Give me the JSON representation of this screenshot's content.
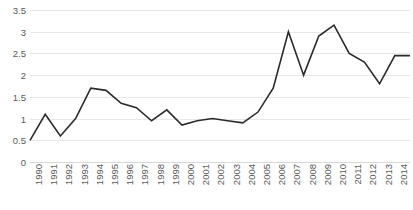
{
  "chart_data": {
    "type": "line",
    "title": "",
    "subtitle": "",
    "xlabel": "",
    "ylabel": "",
    "ylim": [
      0,
      3.5
    ],
    "ytick_values": [
      0,
      0.5,
      1,
      1.5,
      2,
      2.5,
      3,
      3.5
    ],
    "ytick_labels": [
      "0",
      "0.5",
      "1",
      "1.5",
      "2",
      "2.5",
      "3",
      "3.5"
    ],
    "grid": true,
    "legend": false,
    "legend_position": "none",
    "line_color": "#2b2b2b",
    "categories": [
      "1990",
      "1991",
      "1992",
      "1993",
      "1994",
      "1995",
      "1996",
      "1997",
      "1998",
      "1999",
      "2000",
      "2001",
      "2002",
      "2003",
      "2004",
      "2005",
      "2006",
      "2007",
      "2008",
      "2009",
      "2010",
      "2011",
      "2012",
      "2013",
      "2014",
      "2015"
    ],
    "values": [
      0.5,
      1.1,
      0.6,
      1.0,
      1.7,
      1.65,
      1.35,
      1.25,
      0.95,
      1.2,
      0.85,
      0.95,
      1.0,
      0.95,
      0.9,
      1.15,
      1.7,
      3.0,
      2.0,
      2.9,
      3.15,
      2.5,
      2.3,
      1.8,
      2.45,
      2.45
    ],
    "series": [
      {
        "name": "series-1",
        "values": [
          0.5,
          1.1,
          0.6,
          1.0,
          1.7,
          1.65,
          1.35,
          1.25,
          0.95,
          1.2,
          0.85,
          0.95,
          1.0,
          0.95,
          0.9,
          1.15,
          1.7,
          3.0,
          2.0,
          2.9,
          3.15,
          2.5,
          2.3,
          1.8,
          2.45,
          2.45
        ]
      }
    ]
  }
}
